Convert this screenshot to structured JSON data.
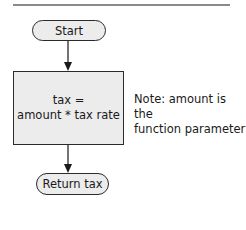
{
  "diagram": {
    "nodes": [
      {
        "id": "start",
        "type": "terminal",
        "label": "Start"
      },
      {
        "id": "calc",
        "type": "process",
        "lines": [
          "tax =",
          "amount * tax rate"
        ]
      },
      {
        "id": "return",
        "type": "terminal",
        "label": "Return tax"
      }
    ],
    "edges": [
      {
        "from": "start",
        "to": "calc"
      },
      {
        "from": "calc",
        "to": "return"
      }
    ],
    "annotation": {
      "lines": [
        "Note: amount is the",
        "function parameter"
      ]
    }
  },
  "colors": {
    "shape_fill": "#ececec",
    "shape_border": "#2a2a2a",
    "rule": "#8a8a8a"
  }
}
